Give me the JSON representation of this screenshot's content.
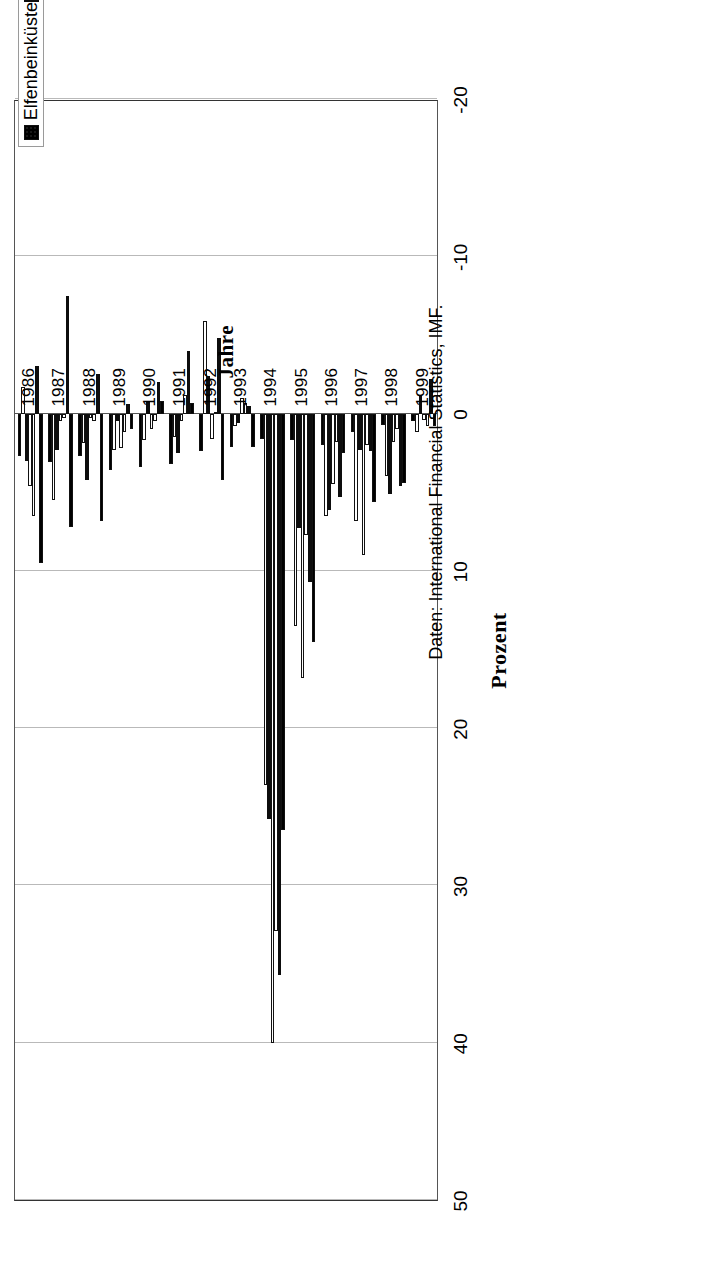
{
  "figure": {
    "value_axis_title": "Prozent",
    "category_axis_title": "Jahre",
    "source_note": "Daten: International Financial Statistics, IMF."
  },
  "axis": {
    "value_ticks": [
      "50",
      "40",
      "30",
      "20",
      "10",
      "0",
      "-10",
      "-20"
    ],
    "year_ticks": [
      "1986",
      "1987",
      "1988",
      "1989",
      "1990",
      "1991",
      "1992",
      "1993",
      "1994",
      "1995",
      "1996",
      "1997",
      "1998",
      "1999"
    ]
  },
  "legend": {
    "items": [
      {
        "label": "Elfenbeinküste",
        "style": "hatch",
        "color": "#2a2a2a"
      },
      {
        "label": "Niger",
        "style": "solid",
        "color": "#0d0d0d"
      },
      {
        "label": "Senegal",
        "style": "open",
        "color": "#ffffff"
      },
      {
        "label": "Togo",
        "style": "open",
        "color": "#ffffff"
      },
      {
        "label": "Burkina Faso",
        "style": "solid",
        "color": "#0d0d0d"
      },
      {
        "label": "Mali",
        "style": "open",
        "color": "#ffffff"
      },
      {
        "label": "Frankreich",
        "style": "hatch",
        "color": "#2a2a2a"
      }
    ]
  },
  "chart_data": {
    "type": "bar",
    "orientation": "vertical-grouped",
    "title": "",
    "xlabel": "Jahre",
    "ylabel": "Prozent",
    "ylim": [
      -20,
      50
    ],
    "ytick_step": 10,
    "grid": true,
    "legend_position": "bottom",
    "categories": [
      "1986",
      "1987",
      "1988",
      "1989",
      "1990",
      "1991",
      "1992",
      "1993",
      "1994",
      "1995",
      "1996",
      "1997",
      "1998",
      "1999"
    ],
    "series": [
      {
        "name": "Elfenbeinküste",
        "style": "hatch",
        "values": [
          9.5,
          7.2,
          6.8,
          1.0,
          -0.8,
          -0.7,
          4.2,
          2.1,
          26.5,
          14.5,
          2.5,
          5.6,
          4.4,
          0.8
        ]
      },
      {
        "name": "Niger",
        "style": "solid",
        "values": [
          -3.0,
          -7.5,
          -2.5,
          -0.6,
          -2.0,
          -4.0,
          -4.8,
          -0.5,
          35.7,
          10.7,
          5.3,
          2.4,
          4.6,
          -2.2
        ]
      },
      {
        "name": "Senegal",
        "style": "open",
        "values": [
          6.5,
          0.3,
          0.5,
          1.2,
          0.5,
          -1.2,
          -0.1,
          -0.7,
          32.9,
          7.7,
          1.8,
          2.0,
          1.0,
          0.8
        ]
      },
      {
        "name": "Togo",
        "style": "open",
        "values": [
          4.6,
          0.5,
          0.3,
          2.2,
          1.0,
          0.5,
          1.6,
          -1.0,
          40.0,
          16.8,
          4.5,
          9.0,
          1.8,
          0.4
        ]
      },
      {
        "name": "Burkina Faso",
        "style": "solid",
        "values": [
          3.0,
          2.3,
          4.2,
          0.5,
          -0.8,
          2.5,
          -2.4,
          0.6,
          25.8,
          7.3,
          6.1,
          2.3,
          5.1,
          -1.1
        ]
      },
      {
        "name": "Mali",
        "style": "open",
        "values": [
          -1.7,
          5.5,
          1.9,
          2.3,
          1.7,
          1.5,
          -5.9,
          0.8,
          23.6,
          13.5,
          6.5,
          6.8,
          4.0,
          1.2
        ]
      },
      {
        "name": "Frankreich",
        "style": "hatch",
        "values": [
          2.7,
          3.1,
          2.7,
          3.6,
          3.4,
          3.2,
          2.4,
          2.1,
          1.6,
          1.7,
          2.0,
          1.2,
          0.7,
          0.5
        ]
      }
    ]
  }
}
